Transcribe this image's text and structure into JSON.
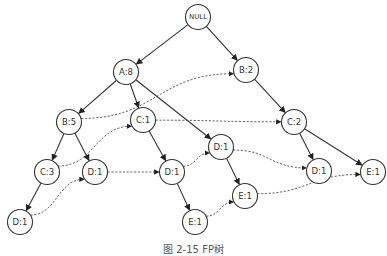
{
  "diagram": {
    "type": "fp-tree",
    "caption": "图 2-15  FP树",
    "nodes": [
      {
        "id": "null",
        "label": "NULL",
        "x": 198,
        "y": 17
      },
      {
        "id": "a8",
        "label": "A:8",
        "x": 126,
        "y": 72
      },
      {
        "id": "b2",
        "label": "B:2",
        "x": 246,
        "y": 70
      },
      {
        "id": "b5",
        "label": "B:5",
        "x": 69,
        "y": 122
      },
      {
        "id": "c1",
        "label": "C:1",
        "x": 143,
        "y": 120
      },
      {
        "id": "c2",
        "label": "C:2",
        "x": 294,
        "y": 122
      },
      {
        "id": "d1_mid",
        "label": "D:1",
        "x": 221,
        "y": 147
      },
      {
        "id": "c3",
        "label": "C:3",
        "x": 47,
        "y": 172
      },
      {
        "id": "d1_b",
        "label": "D:1",
        "x": 95,
        "y": 172
      },
      {
        "id": "d1_c",
        "label": "D:1",
        "x": 172,
        "y": 172
      },
      {
        "id": "d1_r",
        "label": "D:1",
        "x": 319,
        "y": 171
      },
      {
        "id": "e1_r",
        "label": "E:1",
        "x": 373,
        "y": 172
      },
      {
        "id": "d1_l",
        "label": "D:1",
        "x": 20,
        "y": 222
      },
      {
        "id": "e1_mid",
        "label": "E:1",
        "x": 245,
        "y": 196
      },
      {
        "id": "e1_b",
        "label": "E:1",
        "x": 195,
        "y": 222
      }
    ],
    "edges": [
      [
        "null",
        "a8"
      ],
      [
        "null",
        "b2"
      ],
      [
        "a8",
        "b5"
      ],
      [
        "a8",
        "c1"
      ],
      [
        "a8",
        "d1_mid"
      ],
      [
        "b2",
        "c2"
      ],
      [
        "b5",
        "c3"
      ],
      [
        "b5",
        "d1_b"
      ],
      [
        "c1",
        "d1_c"
      ],
      [
        "c2",
        "d1_r"
      ],
      [
        "c2",
        "e1_r"
      ],
      [
        "d1_mid",
        "e1_mid"
      ],
      [
        "c3",
        "d1_l"
      ],
      [
        "d1_c",
        "e1_b"
      ]
    ],
    "node_links": [
      [
        "b5",
        "b2"
      ],
      [
        "c3",
        "c1"
      ],
      [
        "c1",
        "c2"
      ],
      [
        "d1_l",
        "d1_b"
      ],
      [
        "d1_b",
        "d1_c"
      ],
      [
        "d1_c",
        "d1_mid"
      ],
      [
        "d1_mid",
        "d1_r"
      ],
      [
        "e1_b",
        "e1_mid"
      ],
      [
        "e1_mid",
        "e1_r"
      ]
    ]
  }
}
